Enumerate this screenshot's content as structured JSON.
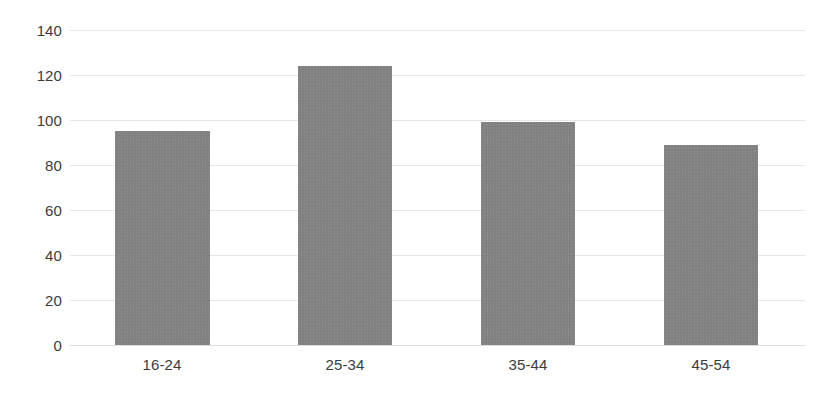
{
  "chart_data": {
    "type": "bar",
    "title": "",
    "subtitle": "",
    "xlabel": "",
    "ylabel": "",
    "categories": [
      "16-24",
      "25-34",
      "35-44",
      "45-54"
    ],
    "values": [
      95,
      124,
      99,
      89
    ],
    "series": [
      {
        "name": "",
        "values": [
          95,
          124,
          99,
          89
        ]
      }
    ],
    "ylim": [
      0,
      140
    ],
    "ytick_labels": [
      "0",
      "20",
      "40",
      "60",
      "80",
      "100",
      "120",
      "140"
    ],
    "ytick_values": [
      0,
      20,
      40,
      60,
      80,
      100,
      120,
      140
    ],
    "grid": true,
    "legend": false,
    "legend_position": "none",
    "bar_color": "#8a8a8a",
    "gridline_color": "#e6e6e6",
    "background_color": "#ffffff",
    "axis_text_color": "#3b3b3b"
  }
}
